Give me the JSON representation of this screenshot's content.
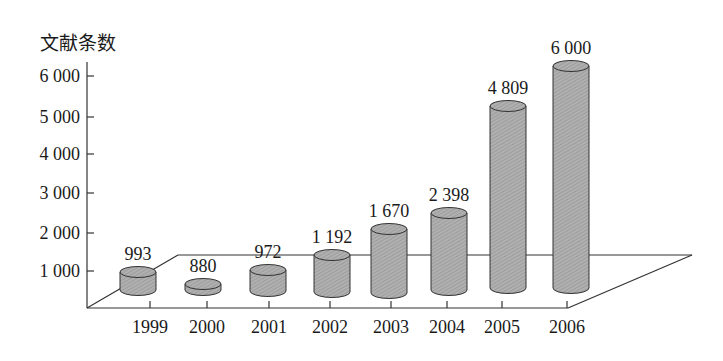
{
  "chart_data": {
    "type": "bar",
    "style": "3d-cylinder",
    "title": "",
    "ylabel": "文献条数",
    "xlabel": "",
    "categories": [
      "1999",
      "2000",
      "2001",
      "2002",
      "2003",
      "2004",
      "2005",
      "2006"
    ],
    "values": [
      993,
      880,
      972,
      1192,
      1670,
      2398,
      4809,
      6000
    ],
    "value_labels": [
      "993",
      "880",
      "972",
      "1 192",
      "1 670",
      "2 398",
      "4 809",
      "6 000"
    ],
    "y_ticks": [
      1000,
      2000,
      3000,
      4000,
      5000,
      6000
    ],
    "y_tick_labels": [
      "1 000",
      "2 000",
      "3 000",
      "4 000",
      "5 000",
      "6 000"
    ],
    "ylim": [
      0,
      6000
    ],
    "grid": false,
    "legend": null,
    "colors": {
      "bar_fill": "#a9a9a9",
      "bar_stroke": "#333333",
      "axis": "#333333",
      "text": "#1a1a1a"
    }
  }
}
